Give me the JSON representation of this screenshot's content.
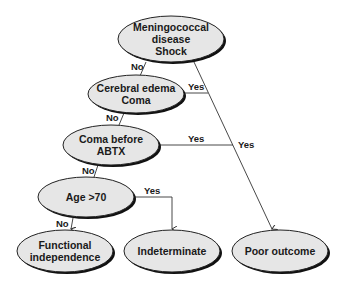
{
  "diagram": {
    "type": "decision-tree",
    "colors": {
      "node_fill": "#e6e6e6",
      "node_stroke": "#222222",
      "shadow": "#111111",
      "edge": "#333333"
    },
    "nodes": {
      "root": {
        "lines": [
          "Meningococcal",
          "disease",
          "Shock"
        ]
      },
      "cerebral": {
        "lines": [
          "Cerebral edema",
          "Coma"
        ]
      },
      "coma_abtx": {
        "lines": [
          "Coma before",
          "ABTX"
        ]
      },
      "age": {
        "lines": [
          "Age >70"
        ]
      },
      "functional": {
        "lines": [
          "Functional",
          "independence"
        ]
      },
      "indeterminate": {
        "lines": [
          "Indeterminate"
        ]
      },
      "poor": {
        "lines": [
          "Poor outcome"
        ]
      }
    },
    "edges": {
      "root_no": "No",
      "root_yes": "Yes",
      "cerebral_no": "No",
      "cerebral_yes": "Yes",
      "coma_no": "No",
      "coma_yes": "Yes",
      "age_no": "No",
      "age_yes": "Yes"
    }
  }
}
